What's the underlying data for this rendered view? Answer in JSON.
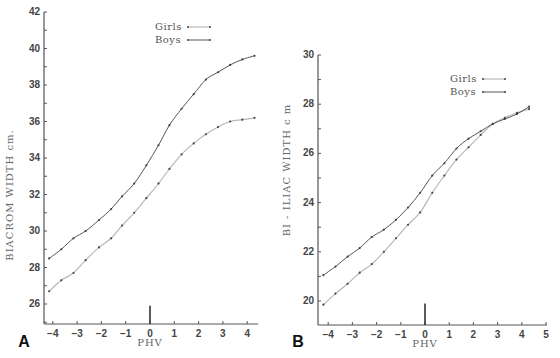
{
  "chart_data": [
    {
      "type": "line",
      "panel": "A",
      "title": "",
      "xlabel": "PHV",
      "ylabel": "BIACROM  WIDTH  cm.",
      "xlim": [
        -4.4,
        4.6
      ],
      "ylim": [
        25,
        42
      ],
      "xticks": [
        -4,
        -3,
        -2,
        -1,
        0,
        1,
        2,
        3,
        4
      ],
      "yticks": [
        26,
        28,
        30,
        32,
        34,
        36,
        38,
        40,
        42
      ],
      "grid": false,
      "legend_position": "upper center",
      "phv_marker": {
        "x": 0,
        "y_top": 25.9
      },
      "series": [
        {
          "name": "Girls",
          "style": "light",
          "x": [
            -4.15,
            -3.65,
            -3.15,
            -2.65,
            -2.1,
            -1.6,
            -1.15,
            -0.65,
            -0.15,
            0.35,
            0.8,
            1.3,
            1.8,
            2.3,
            2.8,
            3.3,
            3.8,
            4.3
          ],
          "values": [
            26.7,
            27.3,
            27.7,
            28.4,
            29.1,
            29.6,
            30.3,
            31.0,
            31.8,
            32.6,
            33.4,
            34.2,
            34.8,
            35.3,
            35.7,
            36.0,
            36.1,
            36.2
          ]
        },
        {
          "name": "Boys",
          "style": "dark",
          "x": [
            -4.15,
            -3.65,
            -3.15,
            -2.65,
            -2.1,
            -1.6,
            -1.15,
            -0.65,
            -0.15,
            0.35,
            0.8,
            1.3,
            1.8,
            2.3,
            2.8,
            3.3,
            3.8,
            4.3
          ],
          "values": [
            28.5,
            29.0,
            29.6,
            30.0,
            30.6,
            31.2,
            31.9,
            32.6,
            33.6,
            34.7,
            35.8,
            36.7,
            37.5,
            38.3,
            38.7,
            39.1,
            39.4,
            39.6
          ]
        }
      ]
    },
    {
      "type": "line",
      "panel": "B",
      "title": "",
      "xlabel": "PHV",
      "ylabel": "BI - ILIAC  WIDTH  c m",
      "xlim": [
        -4.4,
        5.1
      ],
      "ylim": [
        19.1,
        30
      ],
      "xticks": [
        -4,
        -3,
        -2,
        -1,
        0,
        1,
        2,
        3,
        4,
        5
      ],
      "yticks": [
        20,
        22,
        24,
        26,
        28,
        30
      ],
      "grid": false,
      "legend_position": "upper right",
      "phv_marker": {
        "x": 0,
        "y_top": 19.9
      },
      "series": [
        {
          "name": "Girls",
          "style": "light",
          "x": [
            -4.2,
            -3.7,
            -3.2,
            -2.7,
            -2.2,
            -1.7,
            -1.2,
            -0.7,
            -0.2,
            0.3,
            0.8,
            1.3,
            1.8,
            2.3,
            2.8,
            3.3,
            3.8,
            4.3
          ],
          "values": [
            19.85,
            20.3,
            20.7,
            21.15,
            21.5,
            22.0,
            22.55,
            23.1,
            23.6,
            24.4,
            25.1,
            25.75,
            26.25,
            26.75,
            27.2,
            27.45,
            27.65,
            27.8
          ]
        },
        {
          "name": "Boys",
          "style": "dark",
          "x": [
            -4.2,
            -3.7,
            -3.2,
            -2.7,
            -2.2,
            -1.7,
            -1.2,
            -0.7,
            -0.2,
            0.3,
            0.8,
            1.3,
            1.8,
            2.3,
            2.8,
            3.3,
            3.8,
            4.3
          ],
          "values": [
            21.05,
            21.4,
            21.8,
            22.15,
            22.6,
            22.9,
            23.3,
            23.8,
            24.4,
            25.1,
            25.6,
            26.2,
            26.6,
            26.9,
            27.2,
            27.4,
            27.6,
            27.9
          ]
        }
      ]
    }
  ],
  "layout": {
    "panels": [
      {
        "id": "A",
        "x0px": 150,
        "xscale": 24.3,
        "y_ref_val": 42,
        "y_ref_px": 12,
        "yscale": 18.25,
        "axis_left_px": 44,
        "axis_bottom_px": 324,
        "axis_right_px": 258,
        "axis_top_px": 12,
        "label_x": 24,
        "label_y": 347,
        "ytitle_x": 13,
        "ytitle_y": 195,
        "xtitle_y": 346,
        "legend_x": 155,
        "legend_y": 30
      },
      {
        "id": "B",
        "x0px": 425,
        "xscale": 24.2,
        "y_ref_val": 30,
        "y_ref_px": 55,
        "yscale": 24.6,
        "axis_left_px": 318,
        "axis_bottom_px": 325,
        "axis_right_px": 547,
        "axis_top_px": 55,
        "label_x": 298,
        "label_y": 347,
        "ytitle_x": 290,
        "ytitle_y": 170,
        "xtitle_y": 347,
        "legend_x": 450,
        "legend_y": 82
      }
    ],
    "colors": {
      "dark": "#555555",
      "light": "#b8b8b8",
      "axis": "#555555",
      "marker": "#444444"
    }
  },
  "legend": {
    "items": [
      "Girls",
      "Boys"
    ]
  }
}
